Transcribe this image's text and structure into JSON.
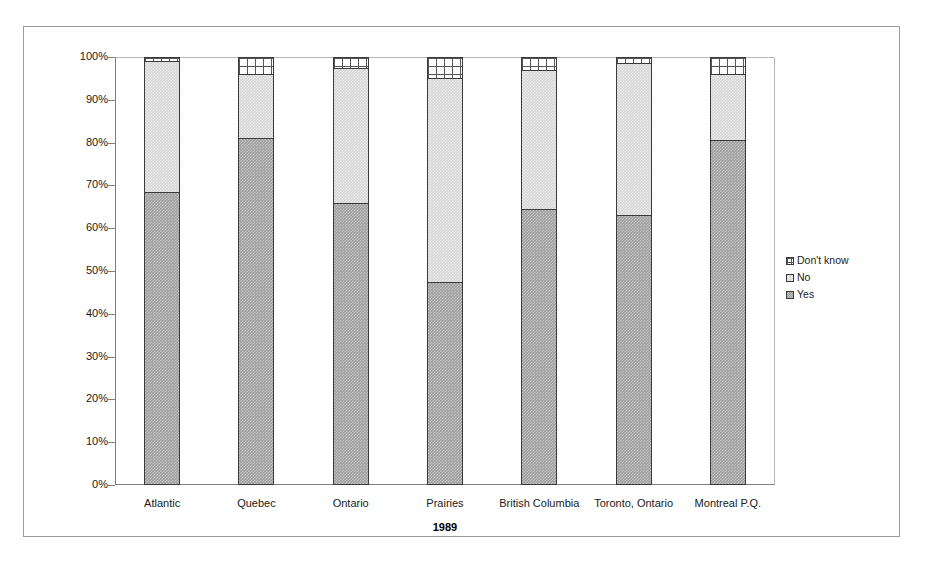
{
  "chart_data": {
    "type": "bar",
    "subtype": "stacked-100-percent",
    "title": "",
    "xlabel": "1989",
    "ylabel": "",
    "ylim": [
      0,
      100
    ],
    "ytick_labels": [
      "100%",
      "90%",
      "80%",
      "70%",
      "60%",
      "50%",
      "40%",
      "30%",
      "20%",
      "10%",
      "0%"
    ],
    "ytick_values": [
      100,
      90,
      80,
      70,
      60,
      50,
      40,
      30,
      20,
      10,
      0
    ],
    "grid": false,
    "legend_position": "right",
    "categories": [
      "Atlantic",
      "Quebec",
      "Ontario",
      "Prairies",
      "British Columbia",
      "Toronto, Ontario",
      "Montreal P.Q."
    ],
    "series": [
      {
        "name": "Yes",
        "values": [
          68.5,
          81.0,
          66.0,
          47.5,
          64.5,
          63.0,
          80.5
        ]
      },
      {
        "name": "No",
        "values": [
          30.5,
          15.0,
          31.5,
          47.5,
          32.5,
          35.5,
          15.5
        ]
      },
      {
        "name": "Don't know",
        "values": [
          1.0,
          4.0,
          2.5,
          5.0,
          3.0,
          1.5,
          4.0
        ]
      }
    ],
    "colors": {
      "yes": "#9d9d9d",
      "no": "#d5d5d5",
      "dont_know": "#ffffff",
      "outline": "#3a3a3a",
      "axis": "#808080",
      "frame": "#9a9a9a"
    }
  },
  "legend": {
    "items": [
      {
        "label": "Don't know",
        "swatch": "dont-know-swatch-icon"
      },
      {
        "label": "No",
        "swatch": "no-swatch-icon"
      },
      {
        "label": "Yes",
        "swatch": "yes-swatch-icon"
      }
    ]
  }
}
